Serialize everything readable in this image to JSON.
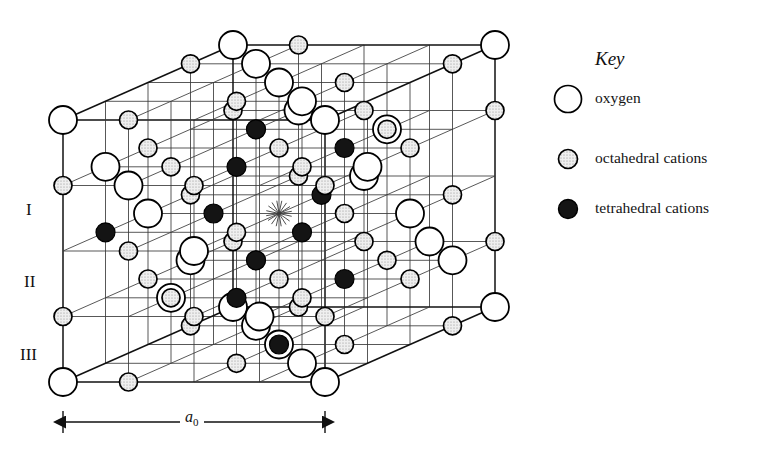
{
  "figure": {
    "kind": "crystal-structure-diagram",
    "projection": "oblique"
  },
  "legend": {
    "title": "Key",
    "items": [
      {
        "symbol": "open-circle",
        "label": "oxygen",
        "fill": "#ffffff",
        "stroke": "#000000",
        "radius": 14
      },
      {
        "symbol": "stippled-circle",
        "label": "octahedral cations",
        "fill": "#e8e8e8",
        "stroke": "#000000",
        "radius": 10
      },
      {
        "symbol": "filled-circle",
        "label": "tetrahedral cations",
        "fill": "#1a1a1a",
        "stroke": "#000000",
        "radius": 10
      }
    ]
  },
  "layer_labels": [
    "I",
    "II",
    "III"
  ],
  "dimension": {
    "label": "a",
    "subscript": "0",
    "x_start": 63,
    "x_end": 325,
    "y": 422
  },
  "geometry": {
    "origin_x": 63,
    "origin_y": 382,
    "cell_width": 262,
    "cell_height": 262,
    "depth_dx": 170,
    "depth_dy": -75,
    "divisions": 4
  },
  "colors": {
    "background": "#ffffff",
    "line": "#3a3a3a",
    "line_strong": "#111111",
    "oxygen_fill": "#ffffff",
    "oxygen_stroke": "#000000",
    "octahedral_fill": "#e6e6e6",
    "octahedral_stroke": "#000000",
    "tetrahedral_fill": "#141414",
    "tetrahedral_stroke": "#000000",
    "text": "#111111"
  },
  "atom_counts": {
    "oxygen": 56,
    "octahedral_cations": 44,
    "tetrahedral_cations": 11
  }
}
